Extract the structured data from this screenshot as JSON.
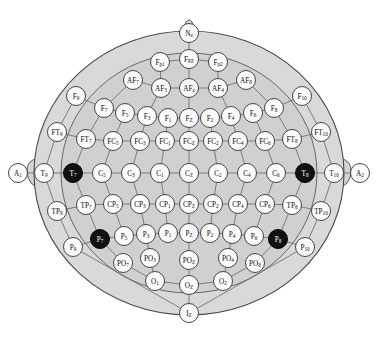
{
  "figure": {
    "caption": "",
    "width": 378,
    "height": 342
  },
  "colors": {
    "head_fill": "#d9d9d9",
    "scalp_fill": "#d0d0d0",
    "electrode_fill": "#fbfbfb",
    "electrode_highlight_fill": "#111111",
    "outline": "#4a4a4a",
    "link": "#6b6b6b",
    "label_text": "#0d0d0d",
    "label_text_inverted": "#ffffff"
  },
  "legend": {
    "highlighted_note": "Filled black electrodes: T7, T8, P7, P8"
  },
  "electrodes": [
    {
      "id": "Nz",
      "base": "N",
      "sub": "z",
      "x": 189,
      "y": 33,
      "r": 9.5,
      "filled": false
    },
    {
      "id": "Fp1",
      "base": "F",
      "sub": "p1",
      "x": 160,
      "y": 62,
      "r": 9.5,
      "filled": false
    },
    {
      "id": "FPZ",
      "base": "F",
      "sub": "PZ",
      "x": 189,
      "y": 59,
      "r": 9.5,
      "filled": false
    },
    {
      "id": "Fp2",
      "base": "F",
      "sub": "p2",
      "x": 218,
      "y": 62,
      "r": 9.5,
      "filled": false
    },
    {
      "id": "AF7",
      "base": "AF",
      "sub": "7",
      "x": 133,
      "y": 80,
      "r": 9.5,
      "filled": false
    },
    {
      "id": "AF3",
      "base": "AF",
      "sub": "3",
      "x": 161,
      "y": 88,
      "r": 9.5,
      "filled": false
    },
    {
      "id": "AFz",
      "base": "AF",
      "sub": "z",
      "x": 189,
      "y": 88,
      "r": 9.5,
      "filled": false
    },
    {
      "id": "AF4",
      "base": "AF",
      "sub": "4",
      "x": 218,
      "y": 88,
      "r": 9.5,
      "filled": false
    },
    {
      "id": "AF8",
      "base": "AF",
      "sub": "8",
      "x": 246,
      "y": 80,
      "r": 9.5,
      "filled": false
    },
    {
      "id": "F9",
      "base": "F",
      "sub": "9",
      "x": 76,
      "y": 96,
      "r": 9.5,
      "filled": false
    },
    {
      "id": "F7",
      "base": "F",
      "sub": "7",
      "x": 104,
      "y": 108,
      "r": 9.5,
      "filled": false
    },
    {
      "id": "F5",
      "base": "F",
      "sub": "5",
      "x": 125,
      "y": 113,
      "r": 9.5,
      "filled": false
    },
    {
      "id": "F3",
      "base": "F",
      "sub": "3",
      "x": 147,
      "y": 116,
      "r": 9.5,
      "filled": false
    },
    {
      "id": "F1",
      "base": "F",
      "sub": "1",
      "x": 168,
      "y": 118,
      "r": 9.5,
      "filled": false
    },
    {
      "id": "Fz",
      "base": "F",
      "sub": "Z",
      "x": 189,
      "y": 118,
      "r": 9.5,
      "filled": false
    },
    {
      "id": "F2",
      "base": "F",
      "sub": "2",
      "x": 210,
      "y": 118,
      "r": 9.5,
      "filled": false
    },
    {
      "id": "F4",
      "base": "F",
      "sub": "4",
      "x": 231,
      "y": 116,
      "r": 9.5,
      "filled": false
    },
    {
      "id": "F6",
      "base": "F",
      "sub": "6",
      "x": 253,
      "y": 113,
      "r": 9.5,
      "filled": false
    },
    {
      "id": "F8",
      "base": "F",
      "sub": "8",
      "x": 274,
      "y": 108,
      "r": 9.5,
      "filled": false
    },
    {
      "id": "F10",
      "base": "F",
      "sub": "10",
      "x": 302,
      "y": 96,
      "r": 9.5,
      "filled": false
    },
    {
      "id": "FT9",
      "base": "FT",
      "sub": "9",
      "x": 57,
      "y": 132,
      "r": 9.5,
      "filled": false
    },
    {
      "id": "FT7",
      "base": "FT",
      "sub": "7",
      "x": 86,
      "y": 139,
      "r": 9.5,
      "filled": false
    },
    {
      "id": "FC5",
      "base": "FC",
      "sub": "5",
      "x": 113,
      "y": 141,
      "r": 9.5,
      "filled": false
    },
    {
      "id": "FC3",
      "base": "FC",
      "sub": "3",
      "x": 140,
      "y": 141,
      "r": 9.5,
      "filled": false
    },
    {
      "id": "FC1",
      "base": "FC",
      "sub": "1",
      "x": 165,
      "y": 141,
      "r": 9.5,
      "filled": false
    },
    {
      "id": "FCz",
      "base": "FC",
      "sub": "Z",
      "x": 189,
      "y": 141,
      "r": 9.5,
      "filled": false
    },
    {
      "id": "FC2",
      "base": "FC",
      "sub": "2",
      "x": 213,
      "y": 141,
      "r": 9.5,
      "filled": false
    },
    {
      "id": "FC4",
      "base": "FC",
      "sub": "4",
      "x": 238,
      "y": 141,
      "r": 9.5,
      "filled": false
    },
    {
      "id": "FC6",
      "base": "FC",
      "sub": "6",
      "x": 265,
      "y": 141,
      "r": 9.5,
      "filled": false
    },
    {
      "id": "FT8",
      "base": "FT",
      "sub": "8",
      "x": 292,
      "y": 139,
      "r": 9.5,
      "filled": false
    },
    {
      "id": "FT10",
      "base": "FT",
      "sub": "10",
      "x": 321,
      "y": 132,
      "r": 9.5,
      "filled": false
    },
    {
      "id": "A1",
      "base": "A",
      "sub": "1",
      "x": 18,
      "y": 173,
      "r": 9.5,
      "filled": false
    },
    {
      "id": "T9",
      "base": "T",
      "sub": "9",
      "x": 44,
      "y": 173,
      "r": 9.5,
      "filled": false
    },
    {
      "id": "T7",
      "base": "T",
      "sub": "7",
      "x": 73,
      "y": 173,
      "r": 9.5,
      "filled": true
    },
    {
      "id": "C5",
      "base": "C",
      "sub": "5",
      "x": 102,
      "y": 173,
      "r": 9.5,
      "filled": false
    },
    {
      "id": "C3",
      "base": "C",
      "sub": "3",
      "x": 131,
      "y": 173,
      "r": 9.5,
      "filled": false
    },
    {
      "id": "C1",
      "base": "C",
      "sub": "1",
      "x": 160,
      "y": 173,
      "r": 9.5,
      "filled": false
    },
    {
      "id": "Cz",
      "base": "C",
      "sub": "Z",
      "x": 189,
      "y": 173,
      "r": 9.5,
      "filled": false
    },
    {
      "id": "C2",
      "base": "C",
      "sub": "2",
      "x": 218,
      "y": 173,
      "r": 9.5,
      "filled": false
    },
    {
      "id": "C4",
      "base": "C",
      "sub": "4",
      "x": 247,
      "y": 173,
      "r": 9.5,
      "filled": false
    },
    {
      "id": "C6",
      "base": "C",
      "sub": "6",
      "x": 276,
      "y": 173,
      "r": 9.5,
      "filled": false
    },
    {
      "id": "T8",
      "base": "T",
      "sub": "8",
      "x": 305,
      "y": 173,
      "r": 9.5,
      "filled": true
    },
    {
      "id": "T10",
      "base": "T",
      "sub": "10",
      "x": 334,
      "y": 173,
      "r": 9.5,
      "filled": false
    },
    {
      "id": "A2",
      "base": "A",
      "sub": "2",
      "x": 360,
      "y": 173,
      "r": 9.5,
      "filled": false
    },
    {
      "id": "TP9",
      "base": "TP",
      "sub": "9",
      "x": 57,
      "y": 211,
      "r": 9.5,
      "filled": false
    },
    {
      "id": "TP7",
      "base": "TP",
      "sub": "7",
      "x": 86,
      "y": 205,
      "r": 9.5,
      "filled": false
    },
    {
      "id": "CP5",
      "base": "CP",
      "sub": "5",
      "x": 113,
      "y": 204,
      "r": 9.5,
      "filled": false
    },
    {
      "id": "CP3",
      "base": "CP",
      "sub": "3",
      "x": 140,
      "y": 204,
      "r": 9.5,
      "filled": false
    },
    {
      "id": "CP1",
      "base": "CP",
      "sub": "1",
      "x": 165,
      "y": 204,
      "r": 9.5,
      "filled": false
    },
    {
      "id": "CPz",
      "base": "CP",
      "sub": "Z",
      "x": 189,
      "y": 204,
      "r": 9.5,
      "filled": false
    },
    {
      "id": "CP2",
      "base": "CP",
      "sub": "2",
      "x": 213,
      "y": 204,
      "r": 9.5,
      "filled": false
    },
    {
      "id": "CP4",
      "base": "CP",
      "sub": "4",
      "x": 238,
      "y": 204,
      "r": 9.5,
      "filled": false
    },
    {
      "id": "CP6",
      "base": "CP",
      "sub": "6",
      "x": 265,
      "y": 204,
      "r": 9.5,
      "filled": false
    },
    {
      "id": "TP8",
      "base": "TP",
      "sub": "8",
      "x": 292,
      "y": 205,
      "r": 9.5,
      "filled": false
    },
    {
      "id": "TP10",
      "base": "TP",
      "sub": "10",
      "x": 321,
      "y": 211,
      "r": 9.5,
      "filled": false
    },
    {
      "id": "P9",
      "base": "P",
      "sub": "9",
      "x": 73,
      "y": 247,
      "r": 9.5,
      "filled": false
    },
    {
      "id": "P7",
      "base": "P",
      "sub": "7",
      "x": 100,
      "y": 239,
      "r": 9.5,
      "filled": true
    },
    {
      "id": "P5",
      "base": "P",
      "sub": "5",
      "x": 124,
      "y": 236,
      "r": 9.5,
      "filled": false
    },
    {
      "id": "P3",
      "base": "P",
      "sub": "3",
      "x": 146,
      "y": 234,
      "r": 9.5,
      "filled": false
    },
    {
      "id": "P1",
      "base": "P",
      "sub": "1",
      "x": 168,
      "y": 233,
      "r": 9.5,
      "filled": false
    },
    {
      "id": "Pz",
      "base": "P",
      "sub": "Z",
      "x": 189,
      "y": 233,
      "r": 9.5,
      "filled": false
    },
    {
      "id": "P2",
      "base": "P",
      "sub": "2",
      "x": 210,
      "y": 233,
      "r": 9.5,
      "filled": false
    },
    {
      "id": "P4",
      "base": "P",
      "sub": "4",
      "x": 232,
      "y": 234,
      "r": 9.5,
      "filled": false
    },
    {
      "id": "P6",
      "base": "P",
      "sub": "6",
      "x": 254,
      "y": 236,
      "r": 9.5,
      "filled": false
    },
    {
      "id": "P8",
      "base": "P",
      "sub": "8",
      "x": 278,
      "y": 239,
      "r": 9.5,
      "filled": true
    },
    {
      "id": "P10",
      "base": "P",
      "sub": "10",
      "x": 305,
      "y": 247,
      "r": 9.5,
      "filled": false
    },
    {
      "id": "PO7",
      "base": "PO",
      "sub": "7",
      "x": 123,
      "y": 263,
      "r": 9.5,
      "filled": false
    },
    {
      "id": "PO3",
      "base": "PO",
      "sub": "3",
      "x": 150,
      "y": 258,
      "r": 9.5,
      "filled": false
    },
    {
      "id": "POz",
      "base": "PO",
      "sub": "Z",
      "x": 189,
      "y": 260,
      "r": 9.5,
      "filled": false
    },
    {
      "id": "PO4",
      "base": "PO",
      "sub": "4",
      "x": 228,
      "y": 258,
      "r": 9.5,
      "filled": false
    },
    {
      "id": "PO8",
      "base": "PO",
      "sub": "8",
      "x": 255,
      "y": 263,
      "r": 9.5,
      "filled": false
    },
    {
      "id": "O1",
      "base": "O",
      "sub": "1",
      "x": 155,
      "y": 281,
      "r": 9.5,
      "filled": false
    },
    {
      "id": "Oz",
      "base": "O",
      "sub": "Z",
      "x": 189,
      "y": 285,
      "r": 9.5,
      "filled": false
    },
    {
      "id": "O2",
      "base": "O",
      "sub": "2",
      "x": 223,
      "y": 281,
      "r": 9.5,
      "filled": false
    },
    {
      "id": "Iz",
      "base": "I",
      "sub": "Z",
      "x": 189,
      "y": 313,
      "r": 9.5,
      "filled": false
    }
  ],
  "links": [
    [
      "Nz",
      "FPZ"
    ],
    [
      "FPZ",
      "Fp1"
    ],
    [
      "FPZ",
      "Fp2"
    ],
    [
      "Fp1",
      "AF3"
    ],
    [
      "Fp2",
      "AF4"
    ],
    [
      "FPZ",
      "AFz"
    ],
    [
      "AF7",
      "AF3"
    ],
    [
      "AF3",
      "AFz"
    ],
    [
      "AFz",
      "AF4"
    ],
    [
      "AF4",
      "AF8"
    ],
    [
      "AF7",
      "F7"
    ],
    [
      "AF8",
      "F8"
    ],
    [
      "AF3",
      "F3"
    ],
    [
      "AF4",
      "F4"
    ],
    [
      "AFz",
      "Fz"
    ],
    [
      "F9",
      "F7"
    ],
    [
      "F7",
      "F5"
    ],
    [
      "F5",
      "F3"
    ],
    [
      "F3",
      "F1"
    ],
    [
      "F1",
      "Fz"
    ],
    [
      "Fz",
      "F2"
    ],
    [
      "F2",
      "F4"
    ],
    [
      "F4",
      "F6"
    ],
    [
      "F6",
      "F8"
    ],
    [
      "F8",
      "F10"
    ],
    [
      "F9",
      "FT9"
    ],
    [
      "F7",
      "FT7"
    ],
    [
      "F5",
      "FC5"
    ],
    [
      "F3",
      "FC3"
    ],
    [
      "F1",
      "FC1"
    ],
    [
      "Fz",
      "FCz"
    ],
    [
      "F2",
      "FC2"
    ],
    [
      "F4",
      "FC4"
    ],
    [
      "F6",
      "FC6"
    ],
    [
      "F8",
      "FT8"
    ],
    [
      "F10",
      "FT10"
    ],
    [
      "FT9",
      "FT7"
    ],
    [
      "FT7",
      "FC5"
    ],
    [
      "FC5",
      "FC3"
    ],
    [
      "FC3",
      "FC1"
    ],
    [
      "FC1",
      "FCz"
    ],
    [
      "FCz",
      "FC2"
    ],
    [
      "FC2",
      "FC4"
    ],
    [
      "FC4",
      "FC6"
    ],
    [
      "FC6",
      "FT8"
    ],
    [
      "FT8",
      "FT10"
    ],
    [
      "FT9",
      "T9"
    ],
    [
      "FT7",
      "T7"
    ],
    [
      "FC5",
      "C5"
    ],
    [
      "FC3",
      "C3"
    ],
    [
      "FC1",
      "C1"
    ],
    [
      "FCz",
      "Cz"
    ],
    [
      "FC2",
      "C2"
    ],
    [
      "FC4",
      "C4"
    ],
    [
      "FC6",
      "C6"
    ],
    [
      "FT8",
      "T8"
    ],
    [
      "FT10",
      "T10"
    ],
    [
      "A1",
      "T9"
    ],
    [
      "T9",
      "T7"
    ],
    [
      "T7",
      "C5"
    ],
    [
      "C5",
      "C3"
    ],
    [
      "C3",
      "C1"
    ],
    [
      "C1",
      "Cz"
    ],
    [
      "Cz",
      "C2"
    ],
    [
      "C2",
      "C4"
    ],
    [
      "C4",
      "C6"
    ],
    [
      "C6",
      "T8"
    ],
    [
      "T8",
      "T10"
    ],
    [
      "T10",
      "A2"
    ],
    [
      "T9",
      "TP9"
    ],
    [
      "T7",
      "TP7"
    ],
    [
      "C5",
      "CP5"
    ],
    [
      "C3",
      "CP3"
    ],
    [
      "C1",
      "CP1"
    ],
    [
      "Cz",
      "CPz"
    ],
    [
      "C2",
      "CP2"
    ],
    [
      "C4",
      "CP4"
    ],
    [
      "C6",
      "CP6"
    ],
    [
      "T8",
      "TP8"
    ],
    [
      "T10",
      "TP10"
    ],
    [
      "TP9",
      "TP7"
    ],
    [
      "TP7",
      "CP5"
    ],
    [
      "CP5",
      "CP3"
    ],
    [
      "CP3",
      "CP1"
    ],
    [
      "CP1",
      "CPz"
    ],
    [
      "CPz",
      "CP2"
    ],
    [
      "CP2",
      "CP4"
    ],
    [
      "CP4",
      "CP6"
    ],
    [
      "CP6",
      "TP8"
    ],
    [
      "TP8",
      "TP10"
    ],
    [
      "TP9",
      "P9"
    ],
    [
      "TP7",
      "P7"
    ],
    [
      "CP5",
      "P5"
    ],
    [
      "CP3",
      "P3"
    ],
    [
      "CP1",
      "P1"
    ],
    [
      "CPz",
      "Pz"
    ],
    [
      "CP2",
      "P2"
    ],
    [
      "CP4",
      "P4"
    ],
    [
      "CP6",
      "P6"
    ],
    [
      "TP8",
      "P8"
    ],
    [
      "TP10",
      "P10"
    ],
    [
      "P9",
      "P7"
    ],
    [
      "P7",
      "P5"
    ],
    [
      "P5",
      "P3"
    ],
    [
      "P3",
      "P1"
    ],
    [
      "P1",
      "Pz"
    ],
    [
      "Pz",
      "P2"
    ],
    [
      "P2",
      "P4"
    ],
    [
      "P4",
      "P6"
    ],
    [
      "P6",
      "P8"
    ],
    [
      "P8",
      "P10"
    ],
    [
      "P7",
      "PO7"
    ],
    [
      "P3",
      "PO3"
    ],
    [
      "Pz",
      "POz"
    ],
    [
      "P4",
      "PO4"
    ],
    [
      "P8",
      "PO8"
    ],
    [
      "PO7",
      "O1"
    ],
    [
      "PO3",
      "O1"
    ],
    [
      "POz",
      "Oz"
    ],
    [
      "PO4",
      "O2"
    ],
    [
      "PO8",
      "O2"
    ],
    [
      "O1",
      "Oz"
    ],
    [
      "Oz",
      "O2"
    ],
    [
      "Oz",
      "Iz"
    ],
    [
      "P9",
      "Iz"
    ],
    [
      "P10",
      "Iz"
    ]
  ]
}
